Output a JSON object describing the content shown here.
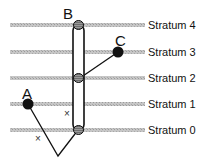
{
  "diagram": {
    "strata": [
      {
        "label": "Stratum 4",
        "y": 25
      },
      {
        "label": "Stratum 3",
        "y": 52
      },
      {
        "label": "Stratum 2",
        "y": 78
      },
      {
        "label": "Stratum 1",
        "y": 104
      },
      {
        "label": "Stratum 0",
        "y": 130
      }
    ],
    "nodes": {
      "A": {
        "label": "A",
        "x": 28,
        "y": 104
      },
      "B": {
        "label": "B",
        "x": 78,
        "top_y": 25,
        "bottom_y": 130
      },
      "C": {
        "label": "C",
        "x": 118,
        "y": 52
      }
    },
    "markers": [
      {
        "symbol": "×",
        "x": 67,
        "y": 113
      },
      {
        "symbol": "×",
        "x": 38,
        "y": 138
      }
    ],
    "colors": {
      "stratum_line": "#b4b4b4",
      "ink": "#111111",
      "knob": "#8a8a8a"
    }
  }
}
